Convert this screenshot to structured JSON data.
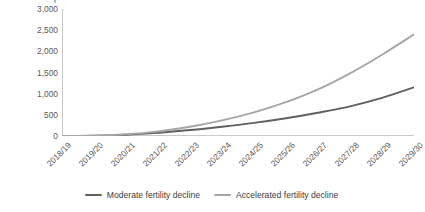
{
  "chart_data": {
    "type": "line",
    "title": "",
    "subtitle": "",
    "xlabel": "",
    "ylabel": "Amount (LE, millions)",
    "categories": [
      "2018/19",
      "2019/20",
      "2020/21",
      "2021/22",
      "2022/23",
      "2023/24",
      "2024/25",
      "2025/26",
      "2026/27",
      "2027/28",
      "2028/29",
      "2029/30"
    ],
    "series": [
      {
        "name": "Moderate fertility decline",
        "color": "#606060",
        "values": [
          0,
          5,
          30,
          75,
          140,
          220,
          310,
          420,
          550,
          700,
          900,
          1150
        ]
      },
      {
        "name": "Accelerated fertility decline",
        "color": "#a6a6a6",
        "values": [
          0,
          5,
          40,
          110,
          220,
          370,
          560,
          800,
          1100,
          1480,
          1920,
          2400
        ]
      }
    ],
    "yticks": [
      0,
      500,
      1000,
      1500,
      2000,
      2500,
      3000
    ],
    "ytick_labels": [
      "0",
      "500",
      "1,000",
      "1,500",
      "2,000",
      "2,500",
      "3,000"
    ],
    "ylim": [
      0,
      3000
    ],
    "grid": false,
    "legend_position": "bottom"
  },
  "axis": {
    "y_title": "Amount (LE, millions)",
    "axis_color": "#c9c9c9",
    "tick_color": "#c9c9c9",
    "text_color": "#595959"
  },
  "legend": {
    "items": [
      {
        "label": "Moderate fertility decline",
        "color": "#606060"
      },
      {
        "label": "Accelerated fertility decline",
        "color": "#a6a6a6"
      }
    ]
  }
}
